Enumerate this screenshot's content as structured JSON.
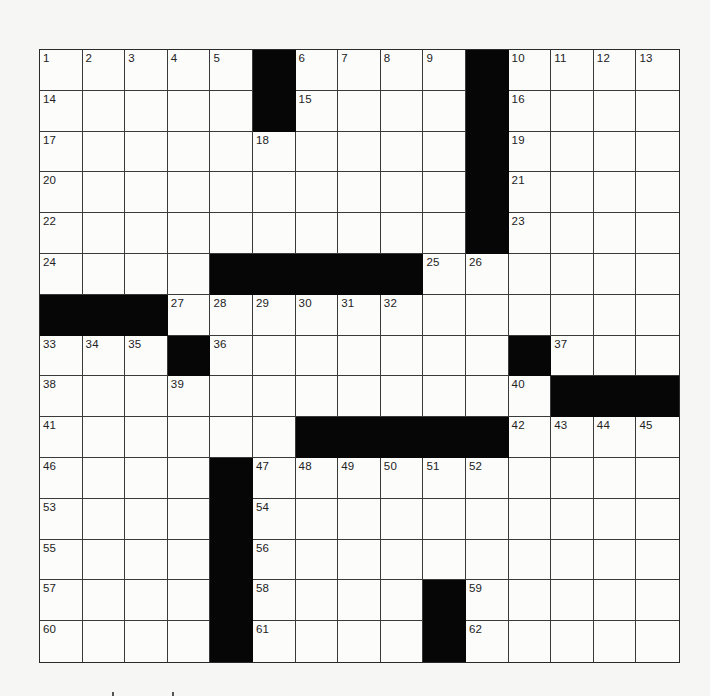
{
  "puzzle": {
    "rows": 15,
    "cols": 15,
    "colors": {
      "black_square": "#060606",
      "white_square": "#fcfcfb",
      "grid_line": "#3a3a3a",
      "number_text": "#222222",
      "page_background": "#f6f6f4"
    },
    "grid": [
      [
        "1",
        "2",
        "3",
        "4",
        "5",
        "#",
        "6",
        "7",
        "8",
        "9",
        "#",
        "10",
        "11",
        "12",
        "13"
      ],
      [
        "14",
        "",
        "",
        "",
        "",
        "#",
        "15",
        "",
        "",
        "",
        "#",
        "16",
        "",
        "",
        ""
      ],
      [
        "17",
        "",
        "",
        "",
        "",
        "18",
        "",
        "",
        "",
        "",
        "#",
        "19",
        "",
        "",
        ""
      ],
      [
        "20",
        "",
        "",
        "",
        "",
        "",
        "",
        "",
        "",
        "",
        "#",
        "21",
        "",
        "",
        ""
      ],
      [
        "22",
        "",
        "",
        "",
        "",
        "",
        "",
        "",
        "",
        "",
        "#",
        "23",
        "",
        "",
        ""
      ],
      [
        "24",
        "",
        "",
        "",
        "#",
        "#",
        "#",
        "#",
        "#",
        "25",
        "26",
        "",
        "",
        "",
        ""
      ],
      [
        "#",
        "#",
        "#",
        "27",
        "28",
        "29",
        "30",
        "31",
        "32",
        "",
        "",
        "",
        "",
        "",
        ""
      ],
      [
        "33",
        "34",
        "35",
        "#",
        "36",
        "",
        "",
        "",
        "",
        "",
        "",
        "#",
        "37",
        "",
        ""
      ],
      [
        "38",
        "",
        "",
        "39",
        "",
        "",
        "",
        "",
        "",
        "",
        "",
        "40",
        "#",
        "#",
        "#"
      ],
      [
        "41",
        "",
        "",
        "",
        "",
        "",
        "#",
        "#",
        "#",
        "#",
        "#",
        "42",
        "43",
        "44",
        "45"
      ],
      [
        "46",
        "",
        "",
        "",
        "#",
        "47",
        "48",
        "49",
        "50",
        "51",
        "52",
        "",
        "",
        "",
        ""
      ],
      [
        "53",
        "",
        "",
        "",
        "#",
        "54",
        "",
        "",
        "",
        "",
        "",
        "",
        "",
        "",
        ""
      ],
      [
        "55",
        "",
        "",
        "",
        "#",
        "56",
        "",
        "",
        "",
        "",
        "",
        "",
        "",
        "",
        ""
      ],
      [
        "57",
        "",
        "",
        "",
        "#",
        "58",
        "",
        "",
        "",
        "#",
        "59",
        "",
        "",
        "",
        ""
      ],
      [
        "60",
        "",
        "",
        "",
        "#",
        "61",
        "",
        "",
        "",
        "#",
        "62",
        "",
        "",
        "",
        ""
      ]
    ],
    "letters": {}
  }
}
